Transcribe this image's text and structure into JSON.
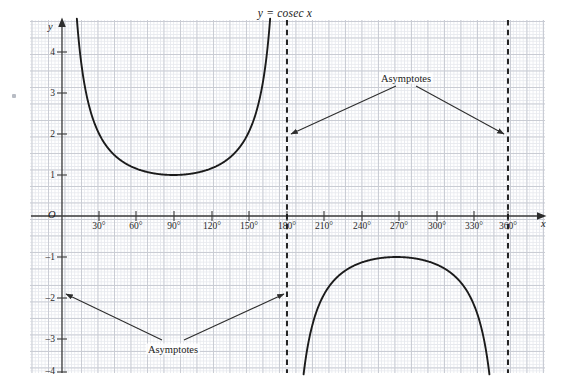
{
  "chart_data": {
    "type": "line",
    "title": "y = cosec x",
    "xlabel": "x",
    "ylabel": "y",
    "xlim": [
      -12,
      378
    ],
    "ylim": [
      -4,
      4.6
    ],
    "grid": true,
    "grid_minor_step": 6,
    "grid_major_step": 30,
    "legend": "none",
    "origin_label": "O",
    "x_ticks": [
      {
        "value": 30,
        "label": "30°"
      },
      {
        "value": 60,
        "label": "60°"
      },
      {
        "value": 90,
        "label": "90°"
      },
      {
        "value": 120,
        "label": "120°"
      },
      {
        "value": 150,
        "label": "150°"
      },
      {
        "value": 180,
        "label": "180°"
      },
      {
        "value": 210,
        "label": "210°"
      },
      {
        "value": 240,
        "label": "240°"
      },
      {
        "value": 270,
        "label": "270°"
      },
      {
        "value": 300,
        "label": "300°"
      },
      {
        "value": 330,
        "label": "330°"
      },
      {
        "value": 360,
        "label": "360°"
      }
    ],
    "y_ticks": [
      {
        "value": 4,
        "label": "4"
      },
      {
        "value": 3,
        "label": "3"
      },
      {
        "value": 2,
        "label": "2"
      },
      {
        "value": 1,
        "label": "1"
      },
      {
        "value": -1,
        "label": "–1"
      },
      {
        "value": -2,
        "label": "–2"
      },
      {
        "value": -3,
        "label": "–3"
      },
      {
        "value": -4,
        "label": "–4"
      }
    ],
    "series": [
      {
        "name": "cosec x (0° to 180° branch)",
        "domain_deg": [
          11.5,
          168.5
        ],
        "minimum": {
          "x": 90,
          "y": 1
        },
        "comment": "y = 1/sin(x); rises to +infinity at 0° and 180°"
      },
      {
        "name": "cosec x (180° to 360° branch)",
        "domain_deg": [
          191.5,
          348.5
        ],
        "maximum": {
          "x": 270,
          "y": -1
        },
        "comment": "y = 1/sin(x); falls to -infinity at 180° and 360°"
      }
    ],
    "asymptotes": [
      {
        "x": 0,
        "style": "solid-axis",
        "label": "Asymptotes"
      },
      {
        "x": 180,
        "style": "dashed",
        "label": "Asymptotes"
      },
      {
        "x": 360,
        "style": "dashed",
        "label": "Asymptotes"
      }
    ],
    "annotations": [
      {
        "id": "asymptotes-upper",
        "text": "Asymptotes",
        "text_x": 270,
        "text_y": 3.1,
        "points_to": [
          {
            "x": 180,
            "y": 2.0
          },
          {
            "x": 360,
            "y": 2.0
          }
        ]
      },
      {
        "id": "asymptotes-lower",
        "text": "Asymptotes",
        "text_x": 105,
        "text_y": -3.35,
        "points_to": [
          {
            "x": 0,
            "y": -2.0
          },
          {
            "x": 180,
            "y": -2.0
          }
        ]
      }
    ],
    "colors": {
      "curve": "#1b1b1b",
      "axis": "#3a3a3a",
      "asymptote": "#1b1b1b",
      "grid_minor": "#e7e9ee",
      "grid_major": "#c9ccd4",
      "text": "#1b1b1b",
      "background": "#ffffff"
    }
  }
}
